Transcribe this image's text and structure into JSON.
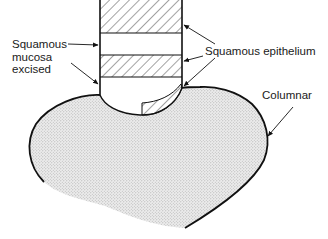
{
  "diagram": {
    "labels": {
      "squamous_mucosa_excised": {
        "line1": "Squamous",
        "line2": "mucosa",
        "line3": "excised"
      },
      "squamous_epithelium": "Squamous epithelium",
      "columnar": "Columnar"
    },
    "colors": {
      "outline": "#111111",
      "hatch": "#333333",
      "stipple": "#c8c8c8",
      "background": "#ffffff"
    }
  }
}
